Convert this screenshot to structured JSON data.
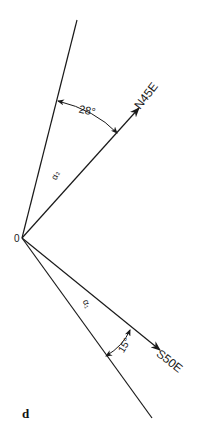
{
  "figure": {
    "panel_label": "d",
    "origin_label": "0",
    "directions": {
      "upper": {
        "label": "N45E"
      },
      "lower": {
        "label": "S50E"
      }
    },
    "angles": {
      "upper_angle": "28°",
      "lower_angle": "15°"
    },
    "sector_labels": {
      "upper": "α₂",
      "lower": "α₁"
    },
    "colors": {
      "line": "#1a1a1a",
      "background": "#ffffff"
    }
  }
}
